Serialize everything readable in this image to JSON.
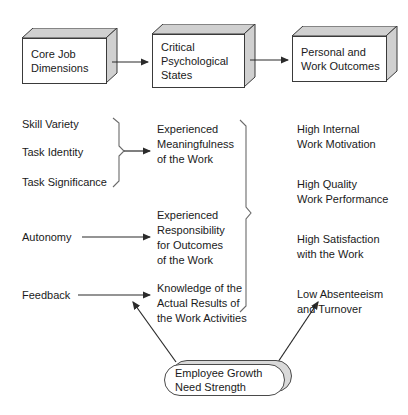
{
  "diagram": {
    "stroke_color": "#3a3a3a",
    "face_shade_color": "#d0d0d0",
    "text_color": "#1a1a1a",
    "background": "#ffffff"
  },
  "top_row": {
    "boxes": [
      {
        "id": "core-job-dimensions",
        "label": "Core Job\nDimensions"
      },
      {
        "id": "critical-psychological-states",
        "label": "Critical\nPsychological\nStates"
      },
      {
        "id": "personal-and-work-outcomes",
        "label": "Personal and\nWork Outcomes"
      }
    ],
    "connectors": [
      {
        "from": "core-job-dimensions",
        "to": "critical-psychological-states",
        "type": "arrow"
      },
      {
        "from": "critical-psychological-states",
        "to": "personal-and-work-outcomes",
        "type": "arrow"
      }
    ]
  },
  "core_job_dimensions": {
    "grouped": [
      {
        "label": "Skill Variety"
      },
      {
        "label": "Task Identity"
      },
      {
        "label": "Task Significance"
      }
    ],
    "singles": [
      {
        "label": "Autonomy"
      },
      {
        "label": "Feedback"
      }
    ]
  },
  "critical_psychological_states": {
    "items": [
      {
        "label": "Experienced\nMeaningfulness\nof the Work"
      },
      {
        "label": "Experienced\nResponsibility\nfor Outcomes\nof the Work"
      },
      {
        "label": "Knowledge of the\nActual Results of\nthe Work Activities"
      }
    ]
  },
  "personal_and_work_outcomes": {
    "items": [
      {
        "label": "High Internal\nWork Motivation"
      },
      {
        "label": "High Quality\nWork Performance"
      },
      {
        "label": "High Satisfaction\nwith the Work"
      },
      {
        "label": "Low Absenteeism\nand Turnover"
      }
    ]
  },
  "moderator": {
    "label": "Employee Growth\nNeed Strength",
    "arrows": [
      {
        "target": "critical-psychological-states-column",
        "direction": "up-left"
      },
      {
        "target": "personal-and-work-outcomes-column",
        "direction": "up-right"
      }
    ]
  }
}
